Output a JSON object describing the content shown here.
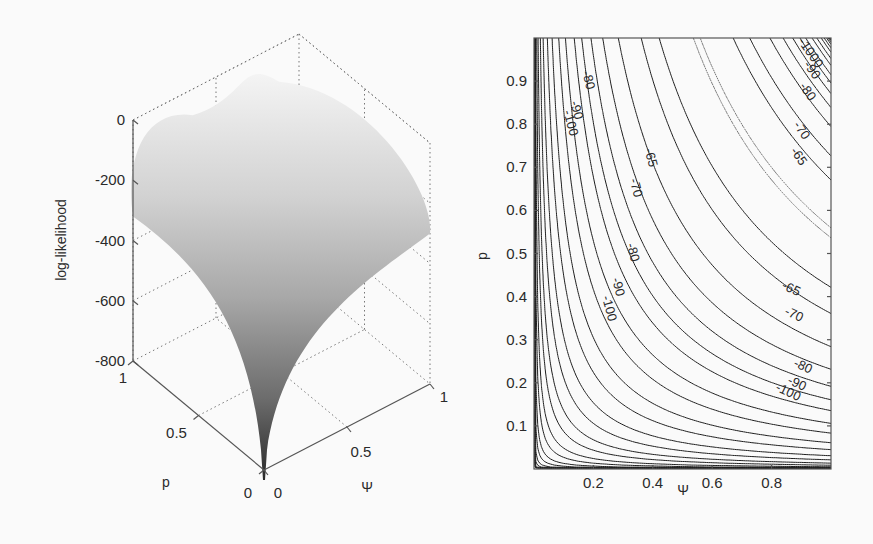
{
  "chart_data": [
    {
      "type": "surface",
      "panel": "left",
      "title": "",
      "zlabel": "log-likelihood",
      "xlabel": "Ψ",
      "ylabel": "p",
      "zlim": [
        -800,
        0
      ],
      "xlim": [
        0,
        1
      ],
      "ylim": [
        0,
        1
      ],
      "z_ticks": [
        0,
        -200,
        -400,
        -600,
        -800
      ],
      "z_tick_labels": [
        "0",
        "-200",
        "-400",
        "-600",
        "-800"
      ],
      "x_ticks": [
        0,
        0.5,
        1
      ],
      "x_tick_labels": [
        "0",
        "0.5",
        "1"
      ],
      "y_ticks": [
        0,
        0.5,
        1
      ],
      "y_tick_labels": [
        "0",
        "0.5",
        "1"
      ],
      "grid": true,
      "colormap": "gray",
      "description": "Log-likelihood surface over (Ψ, p); maximum near ~-60 along the ridge Ψ·p ≈ 0.53, dropping sharply to about -800 as Ψ→0 or p→0."
    },
    {
      "type": "contour",
      "panel": "right",
      "title": "",
      "xlabel": "Ψ",
      "ylabel": "p",
      "xlim": [
        0,
        1
      ],
      "ylim": [
        0,
        1
      ],
      "x_ticks": [
        0.2,
        0.4,
        0.6,
        0.8
      ],
      "x_tick_labels": [
        "0.2",
        "0.4",
        "0.6",
        "0.8"
      ],
      "y_ticks": [
        0.1,
        0.2,
        0.3,
        0.4,
        0.5,
        0.6,
        0.7,
        0.8,
        0.9
      ],
      "y_tick_labels": [
        "0.1",
        "0.2",
        "0.3",
        "0.4",
        "0.5",
        "0.6",
        "0.7",
        "0.8",
        "0.9"
      ],
      "levels_labeled": [
        -65,
        -70,
        -80,
        -90,
        -100
      ],
      "levels": [
        -61,
        -65,
        -70,
        -80,
        -90,
        -100,
        -110,
        -120,
        -135,
        -150,
        -170,
        -190,
        -215,
        -240,
        -270,
        -300,
        -340,
        -380,
        -430,
        -480,
        -540,
        -600,
        -670,
        -740,
        -800
      ],
      "dotted_level": -61,
      "contour_labels": [
        {
          "text": "-80",
          "x": 0.17,
          "y": 0.9
        },
        {
          "text": "-90",
          "x": 0.13,
          "y": 0.83
        },
        {
          "text": "-100",
          "x": 0.11,
          "y": 0.8
        },
        {
          "text": "-65",
          "x": 0.38,
          "y": 0.72
        },
        {
          "text": "-70",
          "x": 0.33,
          "y": 0.65
        },
        {
          "text": "-80",
          "x": 0.32,
          "y": 0.5
        },
        {
          "text": "-90",
          "x": 0.27,
          "y": 0.42
        },
        {
          "text": "-100",
          "x": 0.24,
          "y": 0.37
        },
        {
          "text": "-1000",
          "x": 0.92,
          "y": 0.96
        },
        {
          "text": "-90",
          "x": 0.925,
          "y": 0.92
        },
        {
          "text": "-80",
          "x": 0.91,
          "y": 0.87
        },
        {
          "text": "-70",
          "x": 0.89,
          "y": 0.78
        },
        {
          "text": "-65",
          "x": 0.88,
          "y": 0.72
        },
        {
          "text": "-65",
          "x": 0.86,
          "y": 0.41
        },
        {
          "text": "-70",
          "x": 0.87,
          "y": 0.35
        },
        {
          "text": "-80",
          "x": 0.9,
          "y": 0.23
        },
        {
          "text": "-90",
          "x": 0.88,
          "y": 0.19
        },
        {
          "text": "-100",
          "x": 0.85,
          "y": 0.17
        }
      ],
      "grid": false
    }
  ]
}
